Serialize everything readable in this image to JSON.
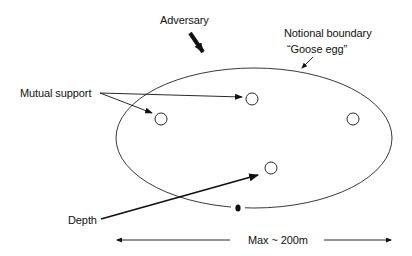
{
  "diagram": {
    "labels": {
      "adversary": "Adversary",
      "boundary_line1": "Notional boundary",
      "boundary_line2": "“Goose egg”",
      "mutual_support": "Mutual support",
      "depth": "Depth",
      "max_distance": "Max ~ 200m"
    },
    "positions": [
      {
        "id": "pos-1",
        "cx": 252,
        "cy": 99
      },
      {
        "id": "pos-2",
        "cx": 161,
        "cy": 119
      },
      {
        "id": "pos-3",
        "cx": 353,
        "cy": 119
      },
      {
        "id": "pos-4",
        "cx": 271,
        "cy": 168
      }
    ],
    "boundary": {
      "cx": 254,
      "cy": 138,
      "rx": 138,
      "ry": 70
    },
    "colors": {
      "ink": "#111111",
      "background": "#ffffff"
    }
  }
}
